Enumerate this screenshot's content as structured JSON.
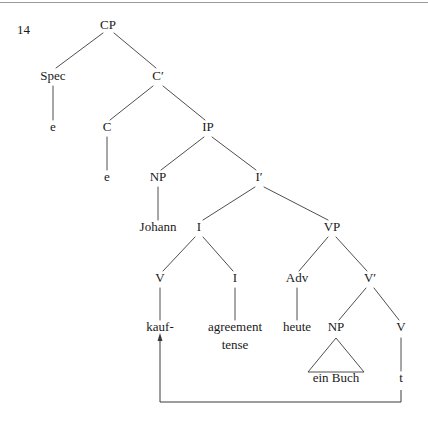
{
  "figure": {
    "example_number": "14",
    "caption": "",
    "width": 428,
    "height": 424,
    "background_color": "#ffffff",
    "line_color": "#3a3a3a",
    "rule_color": "#9a9a9a",
    "text_color": "#1a1a1a"
  },
  "rules": [
    {
      "name": "top-rule",
      "x1": 0,
      "y1": 2.5,
      "x2": 428,
      "y2": 2.5
    }
  ],
  "nodes": [
    {
      "id": "CP",
      "label": "CP",
      "x": 108,
      "y": 29,
      "kind": "nonterminal"
    },
    {
      "id": "Spec",
      "label": "Spec",
      "x": 53,
      "y": 80,
      "kind": "nonterminal"
    },
    {
      "id": "Cbar",
      "label": "C′",
      "x": 158,
      "y": 80,
      "kind": "nonterminal"
    },
    {
      "id": "e1",
      "label": "e",
      "x": 53,
      "y": 131,
      "kind": "terminal"
    },
    {
      "id": "C",
      "label": "C",
      "x": 107,
      "y": 131,
      "kind": "nonterminal"
    },
    {
      "id": "IP",
      "label": "IP",
      "x": 208,
      "y": 131,
      "kind": "nonterminal"
    },
    {
      "id": "e2",
      "label": "e",
      "x": 107,
      "y": 181,
      "kind": "terminal"
    },
    {
      "id": "NP_subj",
      "label": "NP",
      "x": 158,
      "y": 181,
      "kind": "nonterminal"
    },
    {
      "id": "Ibar",
      "label": "I′",
      "x": 259,
      "y": 181,
      "kind": "nonterminal"
    },
    {
      "id": "Johann",
      "label": "Johann",
      "x": 158,
      "y": 231,
      "kind": "terminal"
    },
    {
      "id": "I_max",
      "label": "I",
      "x": 199,
      "y": 231,
      "kind": "nonterminal"
    },
    {
      "id": "VP",
      "label": "VP",
      "x": 332,
      "y": 231,
      "kind": "nonterminal"
    },
    {
      "id": "V_head",
      "label": "V",
      "x": 160,
      "y": 282,
      "kind": "nonterminal"
    },
    {
      "id": "I_infl",
      "label": "I",
      "x": 235,
      "y": 282,
      "kind": "nonterminal"
    },
    {
      "id": "Adv",
      "label": "Adv",
      "x": 297,
      "y": 282,
      "kind": "nonterminal"
    },
    {
      "id": "Vbar",
      "label": "V′",
      "x": 370,
      "y": 282,
      "kind": "nonterminal"
    },
    {
      "id": "kauf",
      "label": "kauf-",
      "x": 160,
      "y": 331,
      "kind": "terminal"
    },
    {
      "id": "agreement",
      "label": "agreement",
      "x": 235,
      "y": 331,
      "kind": "terminal"
    },
    {
      "id": "tense",
      "label": "tense",
      "x": 235,
      "y": 349,
      "kind": "terminal"
    },
    {
      "id": "heute",
      "label": "heute",
      "x": 297,
      "y": 331,
      "kind": "terminal"
    },
    {
      "id": "NP_obj",
      "label": "NP",
      "x": 336,
      "y": 331,
      "kind": "nonterminal"
    },
    {
      "id": "V_trace",
      "label": "V",
      "x": 401,
      "y": 331,
      "kind": "nonterminal"
    },
    {
      "id": "ein_buch",
      "label": "ein Buch",
      "x": 336,
      "y": 382,
      "kind": "terminal"
    },
    {
      "id": "t",
      "label": "t",
      "x": 401,
      "y": 382,
      "kind": "terminal"
    }
  ],
  "branches": [
    {
      "from": "CP",
      "to": "Spec",
      "x1": 103,
      "y1": 33,
      "x2": 56,
      "y2": 68
    },
    {
      "from": "CP",
      "to": "Cbar",
      "x1": 114,
      "y1": 33,
      "x2": 156,
      "y2": 68
    },
    {
      "from": "Spec",
      "to": "e1",
      "x1": 53,
      "y1": 86,
      "x2": 53,
      "y2": 120
    },
    {
      "from": "Cbar",
      "to": "C",
      "x1": 153,
      "y1": 86,
      "x2": 110,
      "y2": 120
    },
    {
      "from": "Cbar",
      "to": "IP",
      "x1": 163,
      "y1": 86,
      "x2": 205,
      "y2": 120
    },
    {
      "from": "C",
      "to": "e2",
      "x1": 107,
      "y1": 137,
      "x2": 107,
      "y2": 170
    },
    {
      "from": "IP",
      "to": "NP_subj",
      "x1": 204,
      "y1": 137,
      "x2": 161,
      "y2": 170
    },
    {
      "from": "IP",
      "to": "Ibar",
      "x1": 212,
      "y1": 137,
      "x2": 256,
      "y2": 170
    },
    {
      "from": "NP_subj",
      "to": "Johann",
      "x1": 158,
      "y1": 187,
      "x2": 158,
      "y2": 220
    },
    {
      "from": "Ibar",
      "to": "I_max",
      "x1": 255,
      "y1": 187,
      "x2": 203,
      "y2": 220
    },
    {
      "from": "Ibar",
      "to": "VP",
      "x1": 264,
      "y1": 187,
      "x2": 328,
      "y2": 220
    },
    {
      "from": "I_max",
      "to": "V_head",
      "x1": 195,
      "y1": 237,
      "x2": 163,
      "y2": 271
    },
    {
      "from": "I_max",
      "to": "I_infl",
      "x1": 203,
      "y1": 237,
      "x2": 233,
      "y2": 271
    },
    {
      "from": "VP",
      "to": "Adv",
      "x1": 328,
      "y1": 237,
      "x2": 299,
      "y2": 271
    },
    {
      "from": "VP",
      "to": "Vbar",
      "x1": 336,
      "y1": 237,
      "x2": 367,
      "y2": 271
    },
    {
      "from": "V_head",
      "to": "kauf",
      "x1": 160,
      "y1": 288,
      "x2": 160,
      "y2": 320
    },
    {
      "from": "I_infl",
      "to": "agreement",
      "x1": 235,
      "y1": 288,
      "x2": 235,
      "y2": 320
    },
    {
      "from": "Adv",
      "to": "heute",
      "x1": 297,
      "y1": 288,
      "x2": 297,
      "y2": 320
    },
    {
      "from": "Vbar",
      "to": "NP_obj",
      "x1": 366,
      "y1": 288,
      "x2": 339,
      "y2": 320
    },
    {
      "from": "Vbar",
      "to": "V_trace",
      "x1": 374,
      "y1": 288,
      "x2": 399,
      "y2": 320
    },
    {
      "from": "V_trace",
      "to": "t",
      "x1": 401,
      "y1": 338,
      "x2": 401,
      "y2": 371
    }
  ],
  "triangles": [
    {
      "name": "np-object-triangle",
      "under": "NP_obj",
      "apex_x": 336,
      "apex_y": 338,
      "left_x": 308,
      "left_y": 372,
      "right_x": 364,
      "right_y": 372,
      "covers": "ein Buch"
    }
  ],
  "movement": [
    {
      "name": "v-to-i-movement",
      "label": "",
      "from_node": "t",
      "to_node": "kauf",
      "path": "M 401 390 L 401 402 L 160 402 L 160 340",
      "arrow_head": {
        "x": 160,
        "y": 333,
        "width": 5,
        "height": 8
      }
    }
  ],
  "glosses": {
    "language": "German",
    "sentence_words": [
      "Johann",
      "kauf-",
      "agreement",
      "tense",
      "heute",
      "ein Buch",
      "t"
    ]
  }
}
